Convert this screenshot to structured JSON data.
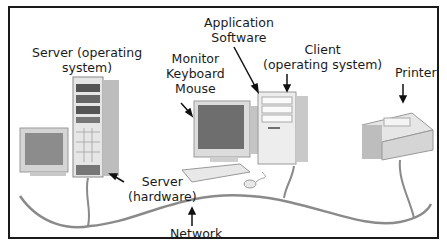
{
  "diagram": {
    "labels": {
      "server_os": [
        "Server (operating",
        "system)"
      ],
      "peripherals": [
        "Monitor",
        "Keyboard",
        "Mouse"
      ],
      "application_software": [
        "Application",
        "Software"
      ],
      "client_os": [
        "Client",
        "(operating system)"
      ],
      "printer": "Printer",
      "server_hw": [
        "Server",
        "(hardware)"
      ],
      "network": "Network"
    },
    "components": [
      "server-workstation-monitor",
      "server-tower",
      "client-monitor",
      "client-keyboard",
      "client-mouse",
      "client-tower",
      "printer",
      "network-cable"
    ],
    "colors": {
      "border": "#1a1a1a",
      "cable": "#8a8a8a",
      "device": "#d9d9d9"
    }
  }
}
